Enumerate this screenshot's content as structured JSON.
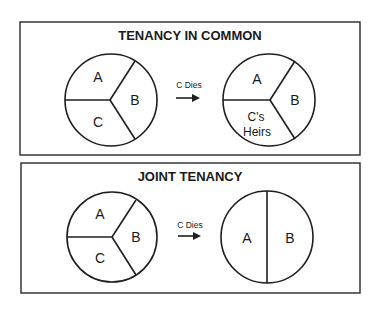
{
  "colors": {
    "stroke": "#1e1e1e",
    "background": "#ffffff",
    "text": "#1a1a1a"
  },
  "panels": [
    {
      "title": "TENANCY IN COMMON",
      "before": {
        "labels": [
          "A",
          "B",
          "C"
        ]
      },
      "arrow": {
        "label": "C Dies",
        "icon": "right-arrow-icon"
      },
      "after": {
        "labels": [
          "A",
          "B"
        ],
        "heirs_line1": "C's",
        "heirs_line2": "Heirs"
      }
    },
    {
      "title": "JOINT TENANCY",
      "before": {
        "labels": [
          "A",
          "B",
          "C"
        ]
      },
      "arrow": {
        "label": "C Dies",
        "icon": "right-arrow-icon"
      },
      "after": {
        "labels": [
          "A",
          "B"
        ]
      }
    }
  ]
}
